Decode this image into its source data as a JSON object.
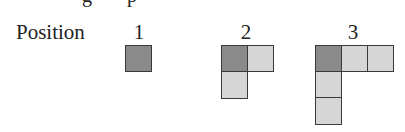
{
  "header": {
    "label": "Position"
  },
  "colors": {
    "dark_fill": "#8a8a8a",
    "light_fill": "#d6d6d6",
    "border": "#3a3a3a"
  },
  "positions": [
    {
      "number": "1",
      "cells": [
        {
          "col": 0,
          "row": 0,
          "shade": "dark"
        }
      ]
    },
    {
      "number": "2",
      "cells": [
        {
          "col": 0,
          "row": 0,
          "shade": "dark"
        },
        {
          "col": 1,
          "row": 0,
          "shade": "light"
        },
        {
          "col": 0,
          "row": 1,
          "shade": "light"
        }
      ]
    },
    {
      "number": "3",
      "cells": [
        {
          "col": 0,
          "row": 0,
          "shade": "dark"
        },
        {
          "col": 1,
          "row": 0,
          "shade": "light"
        },
        {
          "col": 2,
          "row": 0,
          "shade": "light"
        },
        {
          "col": 0,
          "row": 1,
          "shade": "light"
        },
        {
          "col": 0,
          "row": 2,
          "shade": "light"
        }
      ]
    }
  ]
}
